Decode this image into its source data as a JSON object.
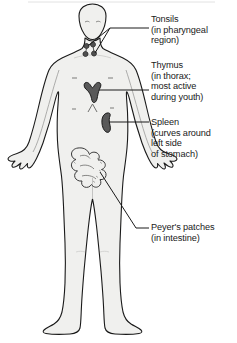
{
  "diagram": {
    "body_fill": "#f0f0ee",
    "outline_color": "#1a1a1a",
    "organ_fill": "#595959",
    "leader_color": "#1a1a1a",
    "background": "#ffffff"
  },
  "labels": {
    "tonsils": {
      "title": "Tonsils",
      "detail_1": "(in pharyngeal",
      "detail_2": "region)"
    },
    "thymus": {
      "title": "Thymus",
      "detail_1": "(in thorax;",
      "detail_2": "most active",
      "detail_3": "during youth)"
    },
    "spleen": {
      "title": "Spleen",
      "detail_1": "(curves around",
      "detail_2": "left side",
      "detail_3": "of stomach)"
    },
    "peyers_patches": {
      "title": "Peyer's patches",
      "detail_1": "(in intestine)"
    }
  },
  "organs": [
    {
      "name": "tonsils",
      "region": "head-pharynx"
    },
    {
      "name": "thymus",
      "region": "upper-thorax"
    },
    {
      "name": "spleen",
      "region": "left-upper-abdomen"
    },
    {
      "name": "peyers-patches",
      "region": "small-intestine"
    }
  ]
}
